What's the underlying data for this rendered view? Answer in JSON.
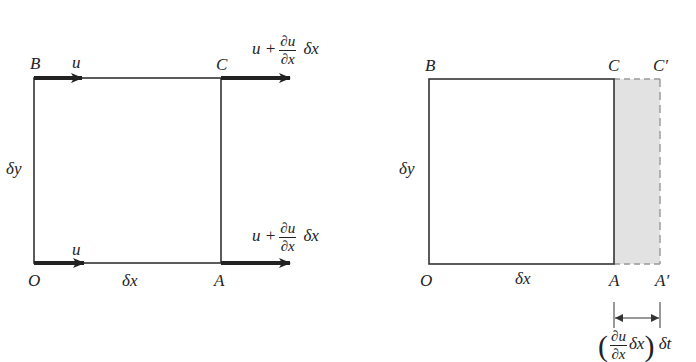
{
  "left_diagram": {
    "corners": {
      "B": "B",
      "C": "C",
      "O": "O",
      "A": "A"
    },
    "side_labels": {
      "height": "δy",
      "width": "δx"
    },
    "velocity_labels": {
      "top_left": "u",
      "bottom_left": "u",
      "top_right": {
        "prefix": "u +",
        "num": "∂u",
        "den": "∂x",
        "suffix": "δx"
      },
      "bottom_right": {
        "prefix": "u +",
        "num": "∂u",
        "den": "∂x",
        "suffix": "δx"
      }
    }
  },
  "right_diagram": {
    "corners": {
      "B": "B",
      "C": "C",
      "C_prime": "C′",
      "O": "O",
      "A": "A",
      "A_prime": "A′"
    },
    "side_labels": {
      "height": "δy",
      "width": "δx"
    },
    "displacement_label": {
      "num": "∂u",
      "den": "∂x",
      "inner": "δx",
      "outer": "δt"
    },
    "shade_color": "#e2e2e2"
  }
}
